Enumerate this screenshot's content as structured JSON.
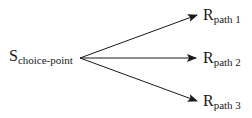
{
  "diagram": {
    "source": {
      "main": "S",
      "subscript": "choice-point"
    },
    "targets": [
      {
        "main": "R",
        "subscript": "path 1"
      },
      {
        "main": "R",
        "subscript": "path 2"
      },
      {
        "main": "R",
        "subscript": "path 3"
      }
    ],
    "line_color": "#1a1a1a"
  }
}
